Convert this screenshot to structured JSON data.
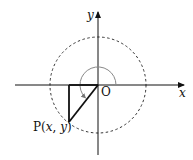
{
  "diagram": {
    "type": "unit-circle-angle",
    "axes": {
      "x_label": "x",
      "y_label": "y",
      "origin_label": "O"
    },
    "point_label_prefix": "P(",
    "point_x": "x",
    "point_sep": ", ",
    "point_y": "y",
    "point_label_suffix": ")",
    "circle_style": "dashed",
    "angle_arc": "counter-clockwise from positive x-axis to OP (~225°)",
    "colors": {
      "lines": "#111111",
      "arc": "#888888"
    }
  }
}
